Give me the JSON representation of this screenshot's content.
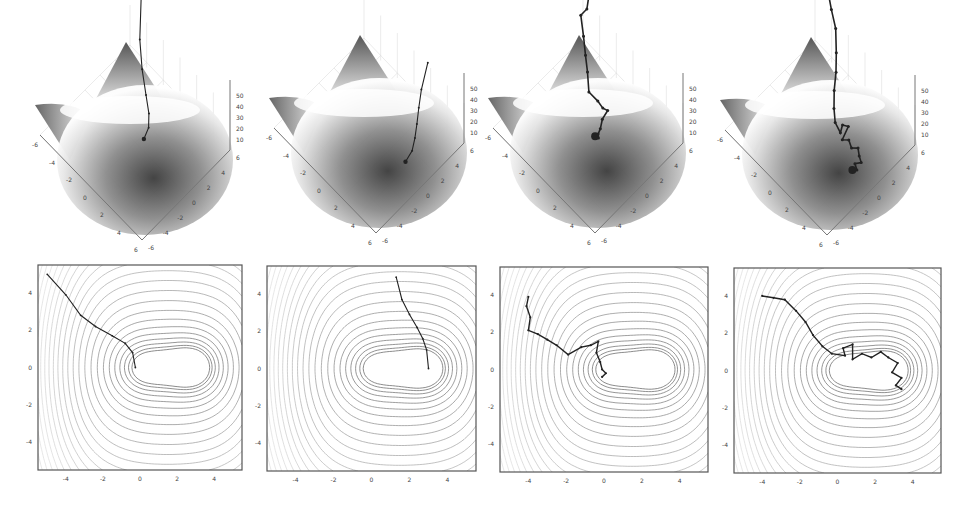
{
  "figure": {
    "width": 977,
    "height": 506,
    "panel_count": 4
  },
  "chart_data": [
    {
      "type": "surface",
      "panel": 1,
      "row": "top",
      "xlabel": "",
      "ylabel": "",
      "zlabel": "",
      "x_ticks": [
        "-6",
        "-4",
        "-2",
        "0",
        "2",
        "4",
        "6"
      ],
      "y_ticks": [
        "-6",
        "-4",
        "-2",
        "0",
        "2",
        "4",
        "6"
      ],
      "z_ticks": [
        "10",
        "20",
        "30",
        "40",
        "50"
      ],
      "zlim": [
        0,
        55
      ],
      "trajectory_style": "smooth",
      "trajectory": [
        [
          -5,
          5
        ],
        [
          -4,
          3.9
        ],
        [
          -3.2,
          2.8
        ],
        [
          -2.4,
          2.2
        ],
        [
          -1.5,
          1.7
        ],
        [
          -0.8,
          1.3
        ],
        [
          -0.4,
          0.8
        ],
        [
          -0.25,
          0
        ]
      ]
    },
    {
      "type": "surface",
      "panel": 2,
      "row": "top",
      "x_ticks": [
        "-6",
        "-4",
        "-2",
        "0",
        "2",
        "4",
        "6"
      ],
      "y_ticks": [
        "-6",
        "-4",
        "-2",
        "0",
        "2",
        "4",
        "6"
      ],
      "z_ticks": [
        "10",
        "20",
        "30",
        "40",
        "50"
      ],
      "zlim": [
        0,
        55
      ],
      "trajectory_style": "smooth",
      "trajectory": [
        [
          1.3,
          4.9
        ],
        [
          1.6,
          3.7
        ],
        [
          2.0,
          2.9
        ],
        [
          2.4,
          2.2
        ],
        [
          2.7,
          1.6
        ],
        [
          2.9,
          1.0
        ],
        [
          3.0,
          0
        ]
      ]
    },
    {
      "type": "surface",
      "panel": 3,
      "row": "top",
      "x_ticks": [
        "-6",
        "-4",
        "-2",
        "0",
        "2",
        "4",
        "6"
      ],
      "y_ticks": [
        "-6",
        "-4",
        "-2",
        "0",
        "2",
        "4",
        "6"
      ],
      "z_ticks": [
        "10",
        "20",
        "30",
        "40",
        "50"
      ],
      "zlim": [
        0,
        55
      ],
      "trajectory_style": "noisy",
      "trajectory": [
        [
          -4,
          3.9
        ],
        [
          -4.1,
          3.4
        ],
        [
          -3.9,
          2.8
        ],
        [
          -4,
          2.1
        ],
        [
          -3.5,
          1.9
        ],
        [
          -3,
          1.6
        ],
        [
          -2.5,
          1.3
        ],
        [
          -1.9,
          0.8
        ],
        [
          -1.2,
          1.2
        ],
        [
          -0.7,
          1.3
        ],
        [
          -0.3,
          1.5
        ],
        [
          -0.4,
          0.9
        ],
        [
          -0.2,
          0.4
        ],
        [
          -0.1,
          0
        ],
        [
          0.1,
          -0.2
        ],
        [
          -0.1,
          -0.4
        ]
      ]
    },
    {
      "type": "surface",
      "panel": 4,
      "row": "top",
      "x_ticks": [
        "-6",
        "-4",
        "-2",
        "0",
        "2",
        "4",
        "6"
      ],
      "y_ticks": [
        "-6",
        "-4",
        "-2",
        "0",
        "2",
        "4",
        "6"
      ],
      "z_ticks": [
        "10",
        "20",
        "30",
        "40",
        "50"
      ],
      "zlim": [
        0,
        55
      ],
      "trajectory_style": "noisy",
      "trajectory": [
        [
          -4,
          4
        ],
        [
          -3.4,
          3.9
        ],
        [
          -2.8,
          3.8
        ],
        [
          -2.2,
          3.2
        ],
        [
          -1.7,
          2.6
        ],
        [
          -1.3,
          1.9
        ],
        [
          -0.8,
          1.3
        ],
        [
          -0.3,
          0.9
        ],
        [
          0.4,
          0.8
        ],
        [
          0.3,
          1.2
        ],
        [
          0.8,
          1.4
        ],
        [
          0.8,
          0.6
        ],
        [
          1.3,
          0.9
        ],
        [
          1.8,
          0.7
        ],
        [
          2.3,
          1.0
        ],
        [
          2.7,
          0.7
        ],
        [
          3.2,
          0.4
        ],
        [
          2.9,
          -0.1
        ],
        [
          3.4,
          -0.4
        ],
        [
          3.1,
          -0.8
        ],
        [
          3.4,
          -1.0
        ]
      ]
    },
    {
      "type": "contour",
      "panel": 1,
      "row": "bottom",
      "x_ticks": [
        "-4",
        "-2",
        "0",
        "2",
        "4"
      ],
      "y_ticks": [
        "4",
        "2",
        "0",
        "-2",
        "-4"
      ],
      "xlim": [
        -5.5,
        5.5
      ],
      "ylim": [
        -5.5,
        5.5
      ],
      "minima": [
        [
          0,
          0
        ],
        [
          3,
          0
        ]
      ],
      "trajectory_ref": 0
    },
    {
      "type": "contour",
      "panel": 2,
      "row": "bottom",
      "x_ticks": [
        "-4",
        "-2",
        "0",
        "2",
        "4"
      ],
      "y_ticks": [
        "4",
        "2",
        "0",
        "-2",
        "-4"
      ],
      "xlim": [
        -5.5,
        5.5
      ],
      "ylim": [
        -5.5,
        5.5
      ],
      "minima": [
        [
          0,
          0
        ],
        [
          3,
          0
        ]
      ],
      "trajectory_ref": 1
    },
    {
      "type": "contour",
      "panel": 3,
      "row": "bottom",
      "x_ticks": [
        "-4",
        "-2",
        "0",
        "2",
        "4"
      ],
      "y_ticks": [
        "4",
        "2",
        "0",
        "-2",
        "-4"
      ],
      "xlim": [
        -5.5,
        5.5
      ],
      "ylim": [
        -5.5,
        5.5
      ],
      "minima": [
        [
          0,
          0
        ],
        [
          3,
          0
        ]
      ],
      "trajectory_ref": 2
    },
    {
      "type": "contour",
      "panel": 4,
      "row": "bottom",
      "x_ticks": [
        "-4",
        "-2",
        "0",
        "2",
        "4"
      ],
      "y_ticks": [
        "4",
        "2",
        "0",
        "-2",
        "-4"
      ],
      "xlim": [
        -5.5,
        5.5
      ],
      "ylim": [
        -5.5,
        5.5
      ],
      "minima": [
        [
          0,
          0
        ],
        [
          3,
          0
        ]
      ],
      "trajectory_ref": 3
    }
  ],
  "layout": {
    "contour_frames": [
      {
        "x": 38,
        "y": 265,
        "w": 204,
        "h": 205
      },
      {
        "x": 267,
        "y": 266,
        "w": 209,
        "h": 205
      },
      {
        "x": 500,
        "y": 267,
        "w": 208,
        "h": 205
      },
      {
        "x": 734,
        "y": 268,
        "w": 207,
        "h": 205
      }
    ],
    "surface_origins": [
      {
        "cx": 140,
        "top": 40
      },
      {
        "cx": 374,
        "top": 33
      },
      {
        "cx": 593,
        "top": 33
      },
      {
        "cx": 825,
        "top": 35
      }
    ]
  },
  "colors": {
    "frame": "#555555",
    "contour": "#6a6a6a",
    "trajectory": "#222222",
    "grid": "#d6d6d6",
    "axis": "#777777"
  }
}
